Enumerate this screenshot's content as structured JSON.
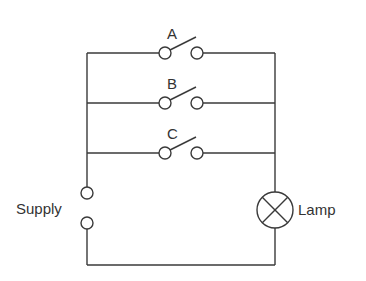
{
  "diagram": {
    "type": "circuit",
    "switches": [
      {
        "label": "A",
        "state": "open"
      },
      {
        "label": "B",
        "state": "open"
      },
      {
        "label": "C",
        "state": "open"
      }
    ],
    "supply": {
      "label": "Supply"
    },
    "lamp": {
      "label": "Lamp"
    },
    "colors": {
      "line": "#3a3a3a",
      "text": "#333333",
      "background": "#ffffff"
    }
  }
}
